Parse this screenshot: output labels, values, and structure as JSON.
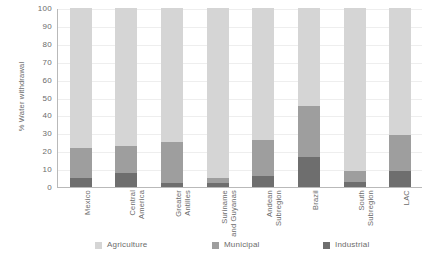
{
  "chart_data": {
    "type": "bar",
    "stacked": true,
    "title": "",
    "xlabel": "",
    "ylabel": "% Water withdrawal",
    "ylim": [
      0,
      100
    ],
    "yticks": [
      0,
      10,
      20,
      30,
      40,
      50,
      60,
      70,
      80,
      90,
      100
    ],
    "ytick_labels": [
      "0",
      "10",
      "20",
      "30",
      "40",
      "50",
      "60",
      "70",
      "80",
      "90",
      "100"
    ],
    "grid": true,
    "legend_position": "bottom",
    "categories": [
      "Mexico",
      "Central\nAmerica",
      "Greater\nAntilles",
      "Suriname\nand Guyanas",
      "Andean\nSubregion",
      "Brazil",
      "South\nSubregion",
      "LAC"
    ],
    "series": [
      {
        "name": "Industrial",
        "color": "#6e6e6e",
        "values": [
          5,
          8,
          2,
          2,
          6,
          17,
          3,
          9
        ]
      },
      {
        "name": "Municipal",
        "color": "#9e9e9e",
        "values": [
          17,
          15,
          23,
          3,
          20,
          28,
          6,
          20
        ]
      },
      {
        "name": "Agriculture",
        "color": "#d5d5d5",
        "values": [
          78,
          77,
          75,
          95,
          74,
          55,
          91,
          71
        ]
      }
    ]
  },
  "axis": {
    "y_title": "% Water withdrawal"
  },
  "legend": {
    "items": [
      {
        "label": "Agriculture",
        "color": "#d5d5d5"
      },
      {
        "label": "Municipal",
        "color": "#9e9e9e"
      },
      {
        "label": "Industrial",
        "color": "#6e6e6e"
      }
    ]
  }
}
